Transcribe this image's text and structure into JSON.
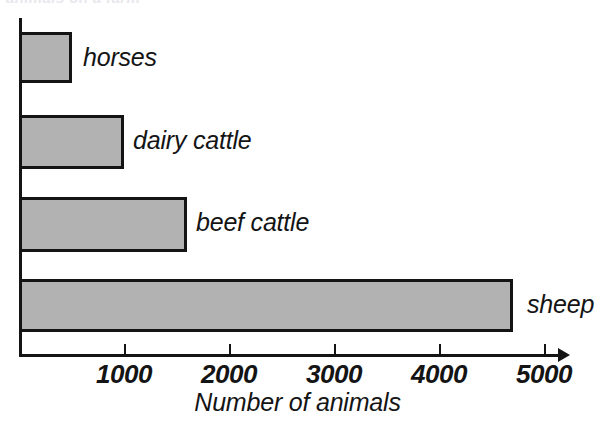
{
  "figure": {
    "clipped_heading": "animals on a farm"
  },
  "chart_data": {
    "type": "bar",
    "orientation": "horizontal",
    "title": "",
    "subtitle": "",
    "xlabel": "Number of animals",
    "ylabel": "",
    "categories": [
      "horses",
      "dairy cattle",
      "beef cattle",
      "sheep"
    ],
    "values": [
      500,
      1000,
      1600,
      4700
    ],
    "xlim": [
      0,
      5250
    ],
    "ylim": null,
    "xticks": [
      1000,
      2000,
      3000,
      4000,
      5000
    ],
    "xtick_labels": [
      "1000",
      "2000",
      "3000",
      "4000",
      "5000"
    ],
    "ytick_labels": [],
    "grid": false,
    "legend": null,
    "legend_position": "none",
    "annotations": [
      {
        "text": "horses",
        "value": 500
      },
      {
        "text": "dairy cattle",
        "value": 1000
      },
      {
        "text": "beef cattle",
        "value": 1600
      },
      {
        "text": "sheep",
        "value": 4700
      }
    ],
    "colors": {
      "bar_fill": "#b2b2b2",
      "bar_edge": "#141414",
      "axis": "#141414",
      "text": "#141414",
      "background": "#ffffff"
    }
  },
  "geometry": {
    "axis_origin_x": 19,
    "px_per_1000": 105,
    "bars": [
      {
        "top": 32,
        "height": 51
      },
      {
        "top": 115,
        "height": 54
      },
      {
        "top": 197,
        "height": 55
      },
      {
        "top": 279,
        "height": 53
      }
    ],
    "label_offsets": [
      {
        "left": 83,
        "top": 43
      },
      {
        "left": 133,
        "top": 126
      },
      {
        "left": 196,
        "top": 208
      },
      {
        "left": 527,
        "top": 290
      }
    ]
  }
}
